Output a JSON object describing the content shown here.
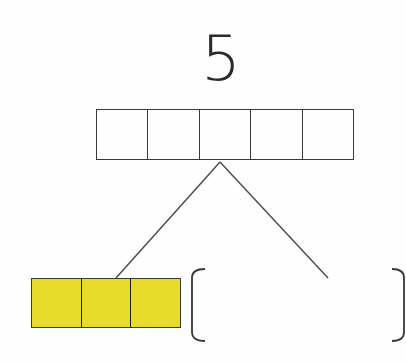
{
  "diagram": {
    "type": "number-bond",
    "whole": {
      "label": "5",
      "boxes": 5,
      "filled": 0
    },
    "parts": [
      {
        "label": "",
        "boxes": 3,
        "filled": 3,
        "color": "#e8dc2a"
      },
      {
        "label": "",
        "blank": true
      }
    ]
  },
  "colors": {
    "fill": "#e8dc2a",
    "stroke": "#3a3a32"
  }
}
